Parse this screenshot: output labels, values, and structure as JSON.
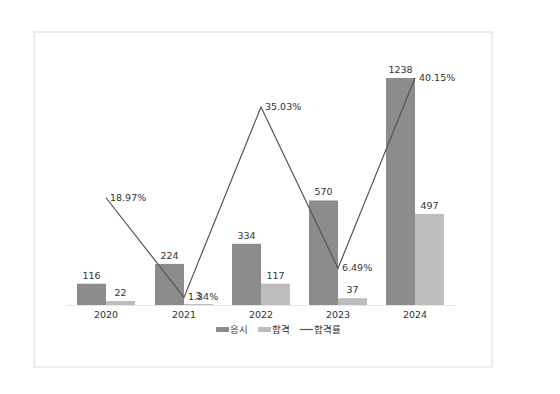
{
  "chart_data": {
    "type": "bar",
    "title": "",
    "xlabel": "",
    "ylabel": "",
    "categories": [
      "2020",
      "2021",
      "2022",
      "2023",
      "2024"
    ],
    "series": [
      {
        "name": "응시",
        "type": "bar",
        "color": "#8c8c8c",
        "values": [
          116,
          224,
          334,
          570,
          1238
        ]
      },
      {
        "name": "합격",
        "type": "bar",
        "color": "#bdbdbd",
        "values": [
          22,
          3,
          117,
          37,
          497
        ]
      },
      {
        "name": "합격률",
        "type": "line",
        "color": "#555555",
        "values": [
          18.97,
          1.34,
          35.03,
          6.49,
          40.15
        ],
        "labels": [
          "18.97%",
          "1.34%",
          "35.03%",
          "6.49%",
          "40.15%"
        ]
      }
    ],
    "ylim": [
      0,
      1238
    ],
    "grid": false,
    "legend_position": "bottom"
  },
  "legend": [
    {
      "label": "응시",
      "kind": "bar",
      "color": "#8c8c8c"
    },
    {
      "label": "합격",
      "kind": "bar",
      "color": "#bdbdbd"
    },
    {
      "label": "합격률",
      "kind": "line",
      "color": "#555555"
    }
  ]
}
